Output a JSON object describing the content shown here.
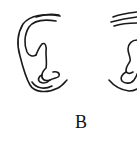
{
  "figure": {
    "panel_label": "B",
    "subjects": [
      "left-ear-drawing",
      "right-ear-drawing"
    ],
    "stroke_color": "#1a1a1a",
    "background": "#ffffff"
  }
}
